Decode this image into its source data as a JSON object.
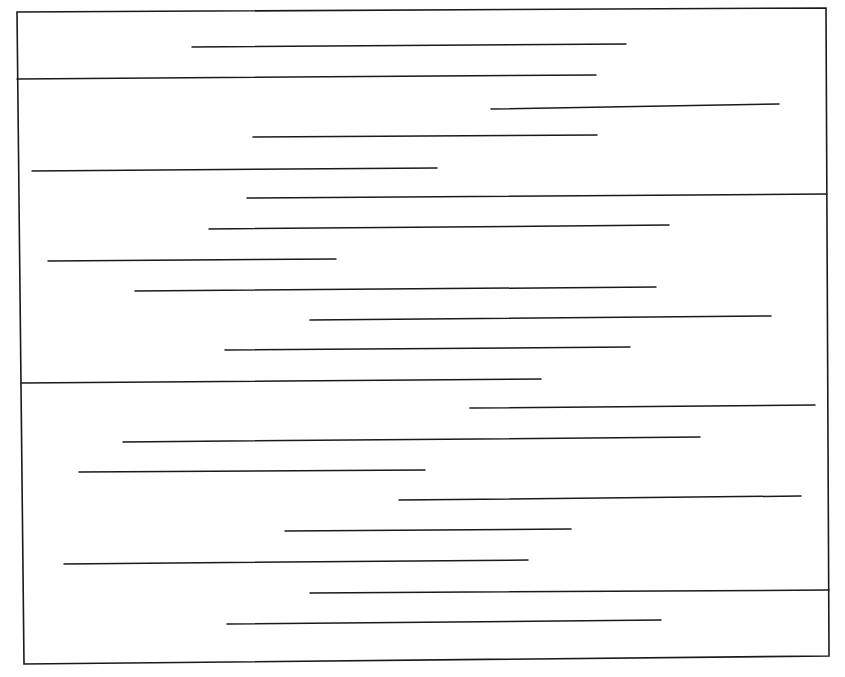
{
  "diagram": {
    "type": "line-segments-in-box",
    "stroke_color": "#1a1a1a",
    "background": "#ffffff",
    "frame": {
      "points": [
        [
          17,
          12
        ],
        [
          826,
          8
        ],
        [
          829,
          656
        ],
        [
          24,
          664
        ]
      ],
      "stroke_width": 1.6
    },
    "segments": [
      {
        "x1": 192,
        "y1": 47,
        "x2": 626,
        "y2": 44
      },
      {
        "x1": 17,
        "y1": 79,
        "x2": 596,
        "y2": 75
      },
      {
        "x1": 491,
        "y1": 109,
        "x2": 779,
        "y2": 104
      },
      {
        "x1": 253,
        "y1": 137,
        "x2": 597,
        "y2": 135
      },
      {
        "x1": 32,
        "y1": 171,
        "x2": 437,
        "y2": 168
      },
      {
        "x1": 247,
        "y1": 198,
        "x2": 826,
        "y2": 194
      },
      {
        "x1": 209,
        "y1": 229,
        "x2": 669,
        "y2": 225
      },
      {
        "x1": 48,
        "y1": 261,
        "x2": 336,
        "y2": 259
      },
      {
        "x1": 135,
        "y1": 291,
        "x2": 656,
        "y2": 287
      },
      {
        "x1": 310,
        "y1": 320,
        "x2": 771,
        "y2": 316
      },
      {
        "x1": 225,
        "y1": 350,
        "x2": 630,
        "y2": 347
      },
      {
        "x1": 21,
        "y1": 383,
        "x2": 541,
        "y2": 379
      },
      {
        "x1": 470,
        "y1": 408,
        "x2": 815,
        "y2": 405
      },
      {
        "x1": 123,
        "y1": 442,
        "x2": 700,
        "y2": 437
      },
      {
        "x1": 79,
        "y1": 472,
        "x2": 425,
        "y2": 470
      },
      {
        "x1": 399,
        "y1": 500,
        "x2": 801,
        "y2": 496
      },
      {
        "x1": 285,
        "y1": 531,
        "x2": 571,
        "y2": 529
      },
      {
        "x1": 64,
        "y1": 564,
        "x2": 528,
        "y2": 560
      },
      {
        "x1": 310,
        "y1": 593,
        "x2": 829,
        "y2": 590
      },
      {
        "x1": 227,
        "y1": 624,
        "x2": 661,
        "y2": 620
      }
    ],
    "segment_stroke_width": 1.5
  }
}
